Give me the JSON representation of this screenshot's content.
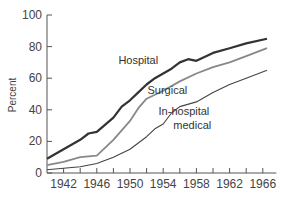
{
  "chart_data": {
    "type": "line",
    "title": "",
    "xlabel": "",
    "ylabel": "Percent",
    "xlim": [
      1940,
      1968
    ],
    "ylim": [
      0,
      100
    ],
    "y_ticks": [
      0,
      20,
      40,
      60,
      80,
      100
    ],
    "x_tick_labels": [
      "1942",
      "1946",
      "1950",
      "1954",
      "1958",
      "1962",
      "1966"
    ],
    "x_minor_ticks_every": 2,
    "grid": false,
    "legend": "inline labels",
    "series": [
      {
        "name": "Hospital",
        "color": "#333333",
        "width": 2.2,
        "x": [
          1940,
          1942,
          1944,
          1945,
          1946,
          1948,
          1949,
          1950,
          1951,
          1952,
          1953,
          1954,
          1955,
          1956,
          1957,
          1958,
          1960,
          1962,
          1964,
          1966.5
        ],
        "values": [
          9,
          15,
          21,
          25,
          26,
          35,
          42,
          46,
          51,
          56,
          60,
          63,
          66,
          70,
          72,
          71,
          76,
          79,
          82,
          85
        ]
      },
      {
        "name": "Surgical",
        "color": "#888888",
        "width": 1.8,
        "x": [
          1940,
          1942,
          1944,
          1946,
          1948,
          1950,
          1951,
          1952,
          1954,
          1956,
          1958,
          1960,
          1962,
          1964,
          1966.5
        ],
        "values": [
          5,
          7,
          10,
          11,
          21,
          33,
          41,
          47,
          52,
          58,
          63,
          67,
          70,
          74,
          79
        ]
      },
      {
        "name": "In-hospital medical",
        "color": "#444444",
        "width": 1.1,
        "x": [
          1940,
          1942,
          1944,
          1946,
          1948,
          1950,
          1952,
          1953,
          1954,
          1955,
          1956,
          1958,
          1960,
          1962,
          1964,
          1966.5
        ],
        "values": [
          2,
          3,
          4,
          6,
          10,
          15,
          23,
          28,
          31,
          38,
          42,
          45,
          51,
          56,
          60,
          65
        ]
      }
    ],
    "annotations": [
      {
        "text": "Hospital",
        "x": 1951,
        "y": 69
      },
      {
        "text": "Surgical",
        "x": 1954.5,
        "y": 50
      },
      {
        "text": "In-hospital",
        "x": 1956.5,
        "y": 37
      },
      {
        "text": "medical",
        "x": 1957.5,
        "y": 28
      }
    ]
  }
}
